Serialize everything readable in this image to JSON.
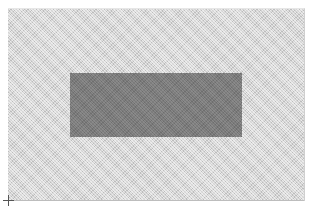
{
  "canvas": {
    "background_color": "#d4d4d4",
    "pattern": "diagonal-hatch",
    "bounds": {
      "x": 8,
      "y": 8,
      "width": 296,
      "height": 192
    }
  },
  "shapes": [
    {
      "type": "rectangle",
      "fill_color": "#7a7a7a",
      "bounds": {
        "x": 70,
        "y": 72,
        "width": 172,
        "height": 64
      }
    }
  ],
  "origin_marker": {
    "icon": "crosshair-icon",
    "position": {
      "x": 8,
      "y": 200
    }
  }
}
